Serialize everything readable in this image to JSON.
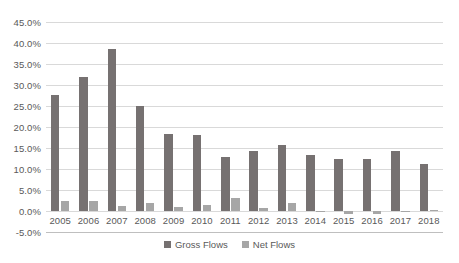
{
  "chart_data": {
    "type": "bar",
    "title": "",
    "subtitle": "",
    "xlabel": "",
    "ylabel": "",
    "ylim": [
      -5,
      45
    ],
    "ytick_step": 5,
    "grid": true,
    "legend_position": "bottom",
    "value_format": "percent",
    "categories": [
      "2005",
      "2006",
      "2007",
      "2008",
      "2009",
      "2010",
      "2011",
      "2012",
      "2013",
      "2014",
      "2015",
      "2016",
      "2017",
      "2018"
    ],
    "y_ticks": [
      45,
      40,
      35,
      30,
      25,
      20,
      15,
      10,
      5,
      0,
      -5
    ],
    "y_tick_labels": [
      "45.0%",
      "40.0%",
      "35.0%",
      "30.0%",
      "25.0%",
      "20.0%",
      "15.0%",
      "10.0%",
      "5.0%",
      "0.0%",
      "-5.0%"
    ],
    "series": [
      {
        "name": "Gross Flows",
        "color": "#767171",
        "values": [
          27.7,
          31.8,
          38.6,
          25.0,
          18.4,
          18.2,
          12.8,
          14.4,
          15.7,
          13.4,
          12.3,
          12.4,
          14.2,
          11.3
        ]
      },
      {
        "name": "Net Flows",
        "color": "#a6a6a6",
        "values": [
          2.4,
          2.5,
          1.3,
          2.0,
          0.9,
          1.5,
          3.0,
          0.7,
          2.0,
          0.1,
          -0.6,
          -0.6,
          0.1,
          0.3
        ]
      }
    ]
  }
}
